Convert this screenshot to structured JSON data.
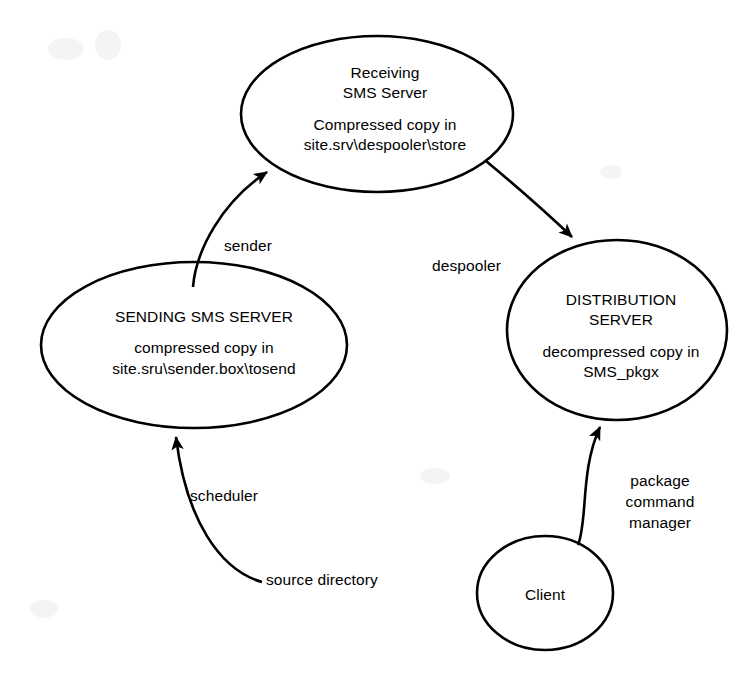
{
  "diagram": {
    "background_color": "#ffffff",
    "stroke_color": "#000000",
    "nodes": [
      {
        "id": "receiving-sms-server",
        "shape": "ellipse",
        "name": "Receiving SMS Server",
        "lines": [
          "Receiving",
          "SMS Server",
          "",
          "Compressed copy in",
          "site.srv\\despooler\\store"
        ]
      },
      {
        "id": "sending-sms-server",
        "shape": "ellipse",
        "name": "SENDING SMS SERVER",
        "lines": [
          "SENDING SMS SERVER",
          "",
          "compressed copy in",
          "site.sru\\sender.box\\tosend"
        ]
      },
      {
        "id": "distribution-server",
        "shape": "ellipse",
        "name": "DISTRIBUTION SERVER",
        "lines": [
          "DISTRIBUTION",
          "SERVER",
          "",
          "decompressed copy in",
          "SMS_pkgx"
        ]
      },
      {
        "id": "client",
        "shape": "circle",
        "name": "Client",
        "lines": [
          "Client"
        ]
      }
    ],
    "edges": [
      {
        "id": "sender-edge",
        "label": "sender",
        "from": "sending-sms-server",
        "to": "receiving-sms-server",
        "arrow": "to"
      },
      {
        "id": "despooler-edge",
        "label": "despooler",
        "from": "receiving-sms-server",
        "to": "distribution-server",
        "arrow": "to"
      },
      {
        "id": "scheduler-edge",
        "label": "scheduler",
        "from": "source-directory",
        "to": "sending-sms-server",
        "arrow": "to"
      },
      {
        "id": "source-directory-edge",
        "label": "source directory",
        "from": "source-directory",
        "to": "sending-sms-server",
        "arrow": "none"
      },
      {
        "id": "package-command-manager-edge",
        "label": "package command manager",
        "label_lines": [
          "package",
          "command",
          "manager"
        ],
        "from": "client",
        "to": "distribution-server",
        "arrow": "to"
      }
    ]
  },
  "node_text": {
    "receiving": {
      "line1": "Receiving",
      "line2": "SMS Server",
      "line3": "Compressed copy in",
      "line4": "site.srv\\despooler\\store"
    },
    "sending": {
      "line1": "SENDING SMS SERVER",
      "line2": "compressed copy in",
      "line3": "site.sru\\sender.box\\tosend"
    },
    "distribution": {
      "line1": "DISTRIBUTION",
      "line2": "SERVER",
      "line3": "decompressed copy in",
      "line4": "SMS_pkgx"
    },
    "client": {
      "line1": "Client"
    }
  },
  "edge_text": {
    "sender": "sender",
    "despooler": "despooler",
    "scheduler": "scheduler",
    "source_directory": "source directory",
    "package": "package",
    "command": "command",
    "manager": "manager"
  }
}
